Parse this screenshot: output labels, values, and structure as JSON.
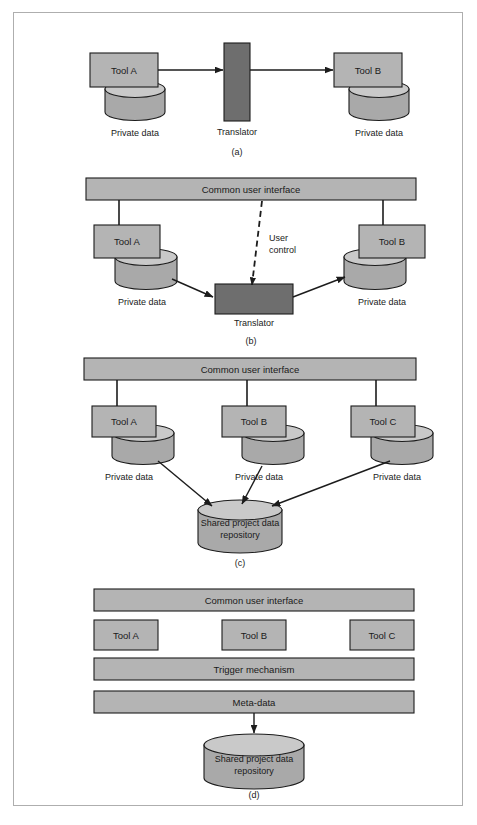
{
  "figure": {
    "caption_a": "(a)",
    "caption_b": "(b)",
    "caption_c": "(c)",
    "caption_d": "(d)",
    "colors": {
      "box": "#b4b4b4",
      "dark_box": "#6e6e6e",
      "cylinder_body": "#a9a9a9",
      "cylinder_top": "#c9c9c9",
      "stroke": "#1c1c1c",
      "frame": "#aeaeae",
      "background": "#ffffff"
    }
  },
  "labels": {
    "tool_a": "Tool A",
    "tool_b": "Tool B",
    "tool_c": "Tool C",
    "translator": "Translator",
    "private_data": "Private data",
    "common_user_interface": "Common user interface",
    "user_control_line1": "User",
    "user_control_line2": "control",
    "shared_repo_line1": "Shared project data",
    "shared_repo_line2": "repository",
    "trigger_mechanism": "Trigger mechanism",
    "meta_data": "Meta-data"
  },
  "panel_a": {
    "title": "Point-to-point tool integration via translator",
    "tools": [
      {
        "name": "Tool A",
        "data_label": "Private data"
      },
      {
        "name": "Tool B",
        "data_label": "Private data"
      }
    ],
    "translator": "Translator",
    "caption": "(a)"
  },
  "panel_b": {
    "title": "Integration with common user interface and user-controlled translator",
    "interface_bar": "Common user interface",
    "tools": [
      {
        "name": "Tool A",
        "data_label": "Private data"
      },
      {
        "name": "Tool B",
        "data_label": "Private data"
      }
    ],
    "translator": "Translator",
    "control_label_line1": "User",
    "control_label_line2": "control",
    "caption": "(b)"
  },
  "panel_c": {
    "title": "Shared repository integration",
    "interface_bar": "Common user interface",
    "tools": [
      {
        "name": "Tool A",
        "data_label": "Private data"
      },
      {
        "name": "Tool B",
        "data_label": "Private data"
      },
      {
        "name": "Tool C",
        "data_label": "Private data"
      }
    ],
    "repository_line1": "Shared project data",
    "repository_line2": "repository",
    "caption": "(c)"
  },
  "panel_d": {
    "title": "Full integration with trigger mechanism and meta-data",
    "bars": [
      "Common user interface",
      "Trigger mechanism",
      "Meta-data"
    ],
    "tools": [
      {
        "name": "Tool A"
      },
      {
        "name": "Tool B"
      },
      {
        "name": "Tool C"
      }
    ],
    "repository_line1": "Shared project data",
    "repository_line2": "repository",
    "caption": "(d)"
  }
}
